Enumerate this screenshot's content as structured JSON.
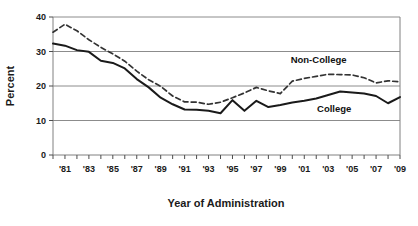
{
  "chart_data": {
    "type": "line",
    "title": "",
    "xlabel": "Year of Administration",
    "ylabel": "Percent",
    "xlim": [
      1980,
      2009
    ],
    "ylim": [
      0,
      40
    ],
    "yticks": [
      0,
      10,
      20,
      30,
      40
    ],
    "ytick_labels": [
      "0",
      "10",
      "20",
      "30",
      "40"
    ],
    "xticks": [
      1981,
      1983,
      1985,
      1987,
      1989,
      1991,
      1993,
      1995,
      1997,
      1999,
      2001,
      2003,
      2005,
      2007,
      2009
    ],
    "xtick_labels": [
      "'81",
      "'83",
      "'85",
      "'87",
      "'89",
      "'91",
      "'93",
      "'95",
      "'97",
      "'99",
      "'01",
      "'03",
      "'05",
      "'07",
      "'09"
    ],
    "minor_xticks_every": 1,
    "grid": "horizontal",
    "legend_position": "inline-annotation",
    "x": [
      1980,
      1981,
      1982,
      1983,
      1984,
      1985,
      1986,
      1987,
      1988,
      1989,
      1990,
      1991,
      1992,
      1993,
      1994,
      1995,
      1996,
      1997,
      1998,
      1999,
      2000,
      2001,
      2002,
      2003,
      2004,
      2005,
      2006,
      2007,
      2008,
      2009
    ],
    "series": [
      {
        "name": "Non-College",
        "style": "dashed",
        "color": "#333333",
        "label_text": "Non-College",
        "values": [
          35.6,
          37.9,
          36.0,
          33.4,
          31.2,
          29.3,
          27.2,
          24.3,
          21.8,
          19.9,
          17.1,
          15.4,
          15.3,
          14.7,
          15.3,
          16.6,
          18.0,
          19.6,
          18.6,
          17.8,
          21.4,
          22.2,
          22.8,
          23.4,
          23.3,
          23.2,
          22.4,
          20.9,
          21.5,
          21.2
        ]
      },
      {
        "name": "College",
        "style": "solid",
        "color": "#1a1a1a",
        "label_text": "College",
        "values": [
          32.3,
          31.7,
          30.4,
          29.9,
          27.3,
          26.7,
          25.1,
          22.0,
          19.6,
          16.6,
          14.7,
          13.2,
          13.1,
          12.8,
          12.1,
          15.9,
          12.8,
          15.7,
          13.9,
          14.5,
          15.2,
          15.7,
          16.4,
          17.4,
          18.4,
          18.1,
          17.8,
          17.1,
          15.0,
          16.8
        ]
      }
    ],
    "annotations": [
      {
        "text": "Non-College",
        "x": 2002.2,
        "y": 26.6
      },
      {
        "text": "College",
        "x": 2003.5,
        "y": 12.6
      }
    ]
  }
}
